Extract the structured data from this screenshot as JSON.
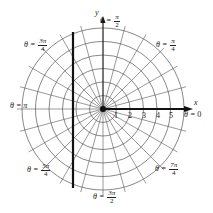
{
  "figure": {
    "type": "polar-grid",
    "center": {
      "x": 103,
      "y": 109
    },
    "ring_spacing_px": 13.5,
    "rings": [
      1,
      2,
      3,
      4,
      5,
      6
    ],
    "radial_line_step_deg": 15,
    "axis_x_label": "x",
    "axis_y_label": "y",
    "radius_tick_labels": [
      "1",
      "2",
      "3",
      "4",
      "5"
    ],
    "angle_labels": {
      "theta0": {
        "prefix": "θ = ",
        "value": "0"
      },
      "pi_over_4": {
        "prefix": "θ = ",
        "num": "π",
        "den": "4"
      },
      "pi_over_2": {
        "prefix": "θ = ",
        "num": "π",
        "den": "2"
      },
      "three_pi_over_4": {
        "prefix": "θ = ",
        "num": "3π",
        "den": "4"
      },
      "pi": {
        "prefix": "θ = ",
        "value": "π"
      },
      "five_pi_over_4": {
        "prefix": "θ = ",
        "num": "5π",
        "den": "4"
      },
      "three_pi_over_2": {
        "prefix": "θ = ",
        "num": "3π",
        "den": "2"
      },
      "seven_pi_over_4": {
        "prefix": "θ = ",
        "num": "7π",
        "den": "4"
      }
    },
    "vertical_line": {
      "x": 73,
      "y1": 32,
      "y2": 188,
      "color": "#111111"
    },
    "colors": {
      "grid": "#555555",
      "axis": "#111111",
      "text": "#222222"
    }
  }
}
